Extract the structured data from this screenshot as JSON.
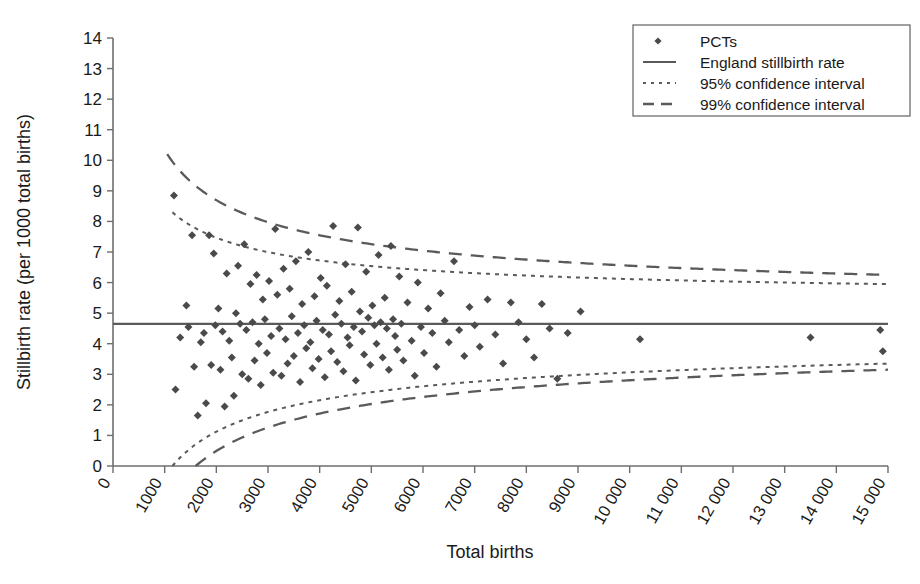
{
  "chart_data": {
    "type": "scatter",
    "title": "",
    "xlabel": "Total births",
    "ylabel": "Stillbirth rate (per 1000 total births)",
    "xlim": [
      0,
      15000
    ],
    "ylim": [
      0,
      14
    ],
    "xticks": [
      0,
      1000,
      2000,
      3000,
      4000,
      5000,
      6000,
      7000,
      8000,
      9000,
      10000,
      11000,
      12000,
      13000,
      14000,
      15000
    ],
    "xtick_labels": [
      "0",
      "1000",
      "2000",
      "3000",
      "4000",
      "5000",
      "6000",
      "7000",
      "8000",
      "9000",
      "10 000",
      "11 000",
      "12 000",
      "13 000",
      "14 000",
      "15 000"
    ],
    "yticks": [
      0,
      1,
      2,
      3,
      4,
      5,
      6,
      7,
      8,
      9,
      10,
      11,
      12,
      13,
      14
    ],
    "ytick_labels": [
      "0",
      "1",
      "2",
      "3",
      "4",
      "5",
      "6",
      "7",
      "8",
      "9",
      "10",
      "11",
      "12",
      "13",
      "14"
    ],
    "grid": false,
    "legend_position": "top-right",
    "england_rate": 4.65,
    "marker": "diamond",
    "marker_color": "#4a4a4a",
    "line_color": "#5a5a5a",
    "axis_color": "#6e6e6e",
    "text_color": "#1a1a1a",
    "legend": [
      {
        "label": "PCTs",
        "style": "marker"
      },
      {
        "label": "England stillbirth rate",
        "style": "solid"
      },
      {
        "label": "95% confidence interval",
        "style": "dotted"
      },
      {
        "label": "99% confidence interval",
        "style": "dashed"
      }
    ],
    "series": [
      {
        "name": "PCTs",
        "points": [
          [
            1180,
            8.85
          ],
          [
            1210,
            2.5
          ],
          [
            1300,
            4.2
          ],
          [
            1420,
            5.25
          ],
          [
            1460,
            4.55
          ],
          [
            1530,
            7.55
          ],
          [
            1570,
            3.25
          ],
          [
            1640,
            1.65
          ],
          [
            1700,
            4.05
          ],
          [
            1760,
            4.35
          ],
          [
            1800,
            2.05
          ],
          [
            1860,
            7.55
          ],
          [
            1900,
            3.3
          ],
          [
            1950,
            6.95
          ],
          [
            1980,
            4.6
          ],
          [
            2040,
            5.15
          ],
          [
            2080,
            3.15
          ],
          [
            2120,
            4.4
          ],
          [
            2160,
            1.95
          ],
          [
            2200,
            6.3
          ],
          [
            2250,
            4.1
          ],
          [
            2300,
            3.55
          ],
          [
            2340,
            2.3
          ],
          [
            2380,
            5.0
          ],
          [
            2420,
            6.55
          ],
          [
            2460,
            4.65
          ],
          [
            2500,
            3.0
          ],
          [
            2540,
            7.25
          ],
          [
            2580,
            4.45
          ],
          [
            2620,
            2.85
          ],
          [
            2660,
            5.95
          ],
          [
            2700,
            4.7
          ],
          [
            2740,
            3.45
          ],
          [
            2780,
            6.25
          ],
          [
            2820,
            4.0
          ],
          [
            2860,
            2.65
          ],
          [
            2900,
            5.45
          ],
          [
            2940,
            4.8
          ],
          [
            2980,
            3.7
          ],
          [
            3020,
            6.05
          ],
          [
            3060,
            4.25
          ],
          [
            3100,
            3.05
          ],
          [
            3140,
            7.75
          ],
          [
            3180,
            5.6
          ],
          [
            3220,
            4.5
          ],
          [
            3260,
            2.95
          ],
          [
            3300,
            6.45
          ],
          [
            3340,
            4.15
          ],
          [
            3380,
            3.35
          ],
          [
            3420,
            5.8
          ],
          [
            3460,
            4.9
          ],
          [
            3500,
            3.6
          ],
          [
            3540,
            6.7
          ],
          [
            3580,
            4.35
          ],
          [
            3620,
            2.75
          ],
          [
            3660,
            5.3
          ],
          [
            3700,
            4.6
          ],
          [
            3740,
            3.85
          ],
          [
            3780,
            7.0
          ],
          [
            3820,
            4.05
          ],
          [
            3860,
            3.2
          ],
          [
            3900,
            5.55
          ],
          [
            3940,
            4.75
          ],
          [
            3980,
            3.5
          ],
          [
            4020,
            6.15
          ],
          [
            4060,
            4.45
          ],
          [
            4100,
            2.9
          ],
          [
            4140,
            5.9
          ],
          [
            4180,
            4.3
          ],
          [
            4220,
            3.75
          ],
          [
            4260,
            7.85
          ],
          [
            4300,
            4.95
          ],
          [
            4340,
            3.4
          ],
          [
            4380,
            5.4
          ],
          [
            4420,
            4.65
          ],
          [
            4460,
            3.1
          ],
          [
            4500,
            6.6
          ],
          [
            4540,
            4.2
          ],
          [
            4580,
            3.95
          ],
          [
            4620,
            5.7
          ],
          [
            4660,
            4.55
          ],
          [
            4700,
            2.8
          ],
          [
            4740,
            7.8
          ],
          [
            4780,
            5.05
          ],
          [
            4820,
            4.4
          ],
          [
            4860,
            3.65
          ],
          [
            4900,
            6.35
          ],
          [
            4940,
            4.85
          ],
          [
            4980,
            3.3
          ],
          [
            5020,
            5.25
          ],
          [
            5060,
            4.6
          ],
          [
            5100,
            4.0
          ],
          [
            5140,
            6.9
          ],
          [
            5180,
            4.7
          ],
          [
            5220,
            3.55
          ],
          [
            5260,
            5.5
          ],
          [
            5300,
            4.5
          ],
          [
            5340,
            3.15
          ],
          [
            5380,
            7.2
          ],
          [
            5420,
            4.8
          ],
          [
            5460,
            4.25
          ],
          [
            5500,
            3.8
          ],
          [
            5540,
            6.2
          ],
          [
            5580,
            4.65
          ],
          [
            5620,
            3.45
          ],
          [
            5700,
            5.35
          ],
          [
            5780,
            4.1
          ],
          [
            5840,
            2.95
          ],
          [
            5900,
            6.0
          ],
          [
            5960,
            4.55
          ],
          [
            6020,
            3.7
          ],
          [
            6100,
            5.15
          ],
          [
            6180,
            4.35
          ],
          [
            6260,
            3.25
          ],
          [
            6340,
            5.65
          ],
          [
            6420,
            4.75
          ],
          [
            6500,
            4.05
          ],
          [
            6600,
            6.7
          ],
          [
            6700,
            4.45
          ],
          [
            6800,
            3.6
          ],
          [
            6900,
            5.2
          ],
          [
            7000,
            4.6
          ],
          [
            7100,
            3.9
          ],
          [
            7250,
            5.45
          ],
          [
            7400,
            4.3
          ],
          [
            7550,
            3.35
          ],
          [
            7700,
            5.35
          ],
          [
            7850,
            4.7
          ],
          [
            8000,
            4.15
          ],
          [
            8150,
            3.55
          ],
          [
            8300,
            5.3
          ],
          [
            8450,
            4.5
          ],
          [
            8600,
            2.85
          ],
          [
            8800,
            4.35
          ],
          [
            9050,
            5.05
          ],
          [
            10200,
            4.15
          ],
          [
            13500,
            4.2
          ],
          [
            14850,
            4.45
          ],
          [
            14900,
            3.75
          ]
        ]
      }
    ],
    "bands": [
      {
        "name": "95% confidence interval",
        "style": "dotted",
        "upper_start": [
          1150,
          8.3
        ],
        "upper_end": [
          15000,
          5.95
        ],
        "lower_start": [
          1150,
          0.0
        ],
        "lower_end": [
          15000,
          3.35
        ]
      },
      {
        "name": "99% confidence interval",
        "style": "dashed",
        "upper_start": [
          1050,
          10.2
        ],
        "upper_end": [
          15000,
          6.25
        ],
        "lower_start": [
          1600,
          0.0
        ],
        "lower_end": [
          15000,
          3.15
        ]
      }
    ]
  }
}
